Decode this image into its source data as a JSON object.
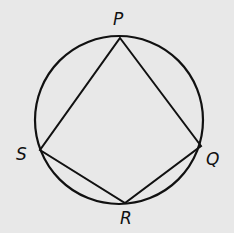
{
  "diagram": {
    "type": "inscribed-quadrilateral",
    "background": "#e8e8e8",
    "stroke_color": "#111111",
    "circle": {
      "cx": 119,
      "cy": 120,
      "r": 84
    },
    "vertices": [
      {
        "name": "P",
        "x": 120,
        "y": 38,
        "label_x": 113,
        "label_y": 11
      },
      {
        "name": "Q",
        "x": 201,
        "y": 146,
        "label_x": 206,
        "label_y": 151
      },
      {
        "name": "R",
        "x": 125,
        "y": 203,
        "label_x": 120,
        "label_y": 210
      },
      {
        "name": "S",
        "x": 40,
        "y": 150,
        "label_x": 16,
        "label_y": 146
      }
    ],
    "edges": [
      [
        "P",
        "Q"
      ],
      [
        "Q",
        "R"
      ],
      [
        "R",
        "S"
      ],
      [
        "S",
        "P"
      ]
    ]
  }
}
